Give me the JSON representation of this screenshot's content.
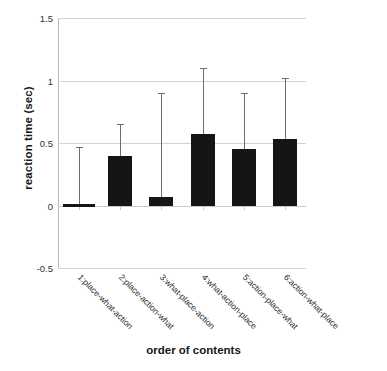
{
  "chart_data": {
    "type": "bar",
    "title": "",
    "xlabel": "order of contents",
    "ylabel": "reaction time (sec)",
    "ylim": [
      -0.5,
      1.5
    ],
    "yticks": [
      "1.5",
      "1",
      "0.5",
      "0",
      "-0.5"
    ],
    "ytick_values": [
      1.5,
      1,
      0.5,
      0,
      -0.5
    ],
    "grid": true,
    "legend": "none",
    "categories": [
      "1:place-what-action",
      "2:place-action-what",
      "3:what-place-action",
      "4:what-action-place",
      "5:action-place-what",
      "6:action-what-place"
    ],
    "values": [
      0.0,
      0.4,
      0.07,
      0.57,
      0.45,
      0.53
    ],
    "error_upper": [
      0.47,
      0.65,
      0.9,
      1.1,
      0.9,
      1.02
    ],
    "series": [
      {
        "name": "reaction time",
        "values": [
          0.0,
          0.4,
          0.07,
          0.57,
          0.45,
          0.53
        ],
        "error_upper": [
          0.47,
          0.65,
          0.9,
          1.1,
          0.9,
          1.02
        ]
      }
    ]
  }
}
